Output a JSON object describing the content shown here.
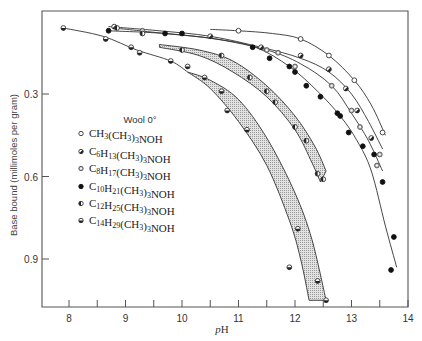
{
  "chart_data": {
    "type": "line",
    "title": "",
    "xlabel": "pH",
    "ylabel": "Base bound (millimoles per gram)",
    "xlim": [
      7.55,
      14
    ],
    "ylim": [
      0.0,
      1.08
    ],
    "y_inverted": true,
    "xticks": [
      8,
      9,
      10,
      11,
      12,
      13,
      14
    ],
    "xticks_minor": [
      8.5,
      9.5,
      10.5,
      11.5,
      12.5,
      13.5
    ],
    "yticks": [
      0.3,
      0.6,
      0.9
    ],
    "grid": false,
    "legend": {
      "title": "Wool 0°",
      "position": "inside-left",
      "entries": [
        {
          "label": "CH3(CH3)3NOH",
          "display": "CH₃(CH₃)₃NOH",
          "marker": "open-circle"
        },
        {
          "label": "C6H13(CH3)3NOH",
          "display": "C₆H₁₃(CH₃)₃NOH",
          "marker": "half-filled-circle"
        },
        {
          "label": "C8H17(CH3)3NOH",
          "display": "C₈H₁₇(CH₃)₃NOH",
          "marker": "gray-circle"
        },
        {
          "label": "C10H21(CH3)3NOH",
          "display": "C₁₀H₂₁(CH₃)₃NOH",
          "marker": "filled-circle"
        },
        {
          "label": "C12H25(CH3)3NOH",
          "display": "C₁₂H₂₅(CH₃)₃NOH",
          "marker": "left-half-circle"
        },
        {
          "label": "C14H29(CH3)3NOH",
          "display": "C₁₄H₂₉(CH₃)₃NOH",
          "marker": "bottom-half-circle"
        }
      ]
    },
    "series": [
      {
        "name": "CH3(CH3)3NOH",
        "marker": "open-circle",
        "points": [
          [
            11.0,
            0.07
          ],
          [
            12.1,
            0.1
          ],
          [
            12.6,
            0.16
          ],
          [
            13.05,
            0.25
          ],
          [
            13.55,
            0.44
          ]
        ],
        "curve": [
          [
            10.5,
            0.065
          ],
          [
            11.0,
            0.07
          ],
          [
            11.6,
            0.08
          ],
          [
            12.1,
            0.1
          ],
          [
            12.6,
            0.16
          ],
          [
            13.05,
            0.25
          ],
          [
            13.35,
            0.34
          ],
          [
            13.6,
            0.45
          ]
        ]
      },
      {
        "name": "C6H13(CH3)3NOH",
        "marker": "half-filled-circle",
        "points": [
          [
            8.8,
            0.055
          ],
          [
            10.5,
            0.09
          ],
          [
            11.4,
            0.13
          ],
          [
            12.1,
            0.16
          ],
          [
            12.6,
            0.21
          ],
          [
            12.9,
            0.28
          ],
          [
            13.1,
            0.36
          ],
          [
            13.35,
            0.46
          ]
        ],
        "curve": [
          [
            8.7,
            0.055
          ],
          [
            9.6,
            0.07
          ],
          [
            10.5,
            0.09
          ],
          [
            11.4,
            0.13
          ],
          [
            12.1,
            0.17
          ],
          [
            12.6,
            0.22
          ],
          [
            13.0,
            0.3
          ],
          [
            13.3,
            0.4
          ],
          [
            13.55,
            0.5
          ]
        ]
      },
      {
        "name": "C8H17(CH3)3NOH",
        "marker": "gray-circle",
        "points": [
          [
            9.3,
            0.07
          ],
          [
            11.5,
            0.14
          ],
          [
            11.7,
            0.15
          ],
          [
            12.0,
            0.2
          ],
          [
            12.65,
            0.27
          ],
          [
            13.0,
            0.36
          ],
          [
            13.15,
            0.42
          ],
          [
            13.5,
            0.52
          ],
          [
            13.45,
            0.56
          ]
        ],
        "curve": [
          [
            8.8,
            0.06
          ],
          [
            9.7,
            0.08
          ],
          [
            10.6,
            0.1
          ],
          [
            11.5,
            0.14
          ],
          [
            12.1,
            0.19
          ],
          [
            12.65,
            0.27
          ],
          [
            13.0,
            0.37
          ],
          [
            13.3,
            0.47
          ],
          [
            13.55,
            0.58
          ]
        ]
      },
      {
        "name": "C10H21(CH3)3NOH",
        "marker": "filled-circle",
        "points": [
          [
            8.7,
            0.07
          ],
          [
            9.7,
            0.08
          ],
          [
            10.0,
            0.08
          ],
          [
            11.25,
            0.13
          ],
          [
            11.55,
            0.17
          ],
          [
            11.9,
            0.2
          ],
          [
            12.0,
            0.22
          ],
          [
            12.2,
            0.27
          ],
          [
            12.45,
            0.31
          ],
          [
            12.75,
            0.37
          ],
          [
            12.8,
            0.38
          ],
          [
            12.95,
            0.44
          ],
          [
            13.2,
            0.49
          ],
          [
            13.4,
            0.52
          ],
          [
            13.55,
            0.62
          ],
          [
            13.75,
            0.82
          ],
          [
            13.7,
            0.94
          ]
        ],
        "curve": [
          [
            8.7,
            0.07
          ],
          [
            9.7,
            0.08
          ],
          [
            10.6,
            0.1
          ],
          [
            11.3,
            0.13
          ],
          [
            11.9,
            0.2
          ],
          [
            12.4,
            0.29
          ],
          [
            12.8,
            0.38
          ],
          [
            13.1,
            0.47
          ],
          [
            13.35,
            0.58
          ],
          [
            13.6,
            0.78
          ],
          [
            13.8,
            0.93
          ]
        ]
      },
      {
        "name": "C12H25(CH3)3NOH",
        "marker": "left-half-circle",
        "points": [
          [
            8.85,
            0.06
          ],
          [
            9.3,
            0.08
          ],
          [
            10.0,
            0.14
          ],
          [
            10.7,
            0.16
          ],
          [
            11.2,
            0.24
          ],
          [
            11.5,
            0.29
          ],
          [
            11.65,
            0.33
          ],
          [
            12.0,
            0.42
          ],
          [
            12.2,
            0.47
          ],
          [
            12.4,
            0.59
          ],
          [
            12.5,
            0.61
          ]
        ],
        "band": {
          "upper": [
            [
              9.6,
              0.12
            ],
            [
              10.3,
              0.14
            ],
            [
              10.9,
              0.18
            ],
            [
              11.5,
              0.27
            ],
            [
              12.0,
              0.38
            ],
            [
              12.35,
              0.49
            ],
            [
              12.55,
              0.58
            ]
          ],
          "lower": [
            [
              9.6,
              0.13
            ],
            [
              10.3,
              0.16
            ],
            [
              10.9,
              0.22
            ],
            [
              11.5,
              0.31
            ],
            [
              12.0,
              0.43
            ],
            [
              12.3,
              0.55
            ],
            [
              12.45,
              0.62
            ]
          ]
        },
        "fill": "#c8c8c8"
      },
      {
        "name": "C14H29(CH3)3NOH",
        "marker": "bottom-half-circle",
        "points": [
          [
            7.9,
            0.06
          ],
          [
            8.65,
            0.1
          ],
          [
            9.1,
            0.13
          ],
          [
            9.25,
            0.15
          ],
          [
            9.8,
            0.18
          ],
          [
            10.1,
            0.2
          ],
          [
            10.4,
            0.24
          ],
          [
            10.7,
            0.29
          ],
          [
            10.8,
            0.36
          ],
          [
            11.15,
            0.43
          ],
          [
            12.05,
            0.79
          ],
          [
            11.9,
            0.93
          ],
          [
            12.4,
            0.98
          ],
          [
            12.55,
            1.05
          ]
        ],
        "band": {
          "upper": [
            [
              10.1,
              0.22
            ],
            [
              10.5,
              0.25
            ],
            [
              11.0,
              0.32
            ],
            [
              11.5,
              0.46
            ],
            [
              12.0,
              0.66
            ],
            [
              12.3,
              0.83
            ],
            [
              12.55,
              1.05
            ]
          ],
          "lower": [
            [
              10.1,
              0.22
            ],
            [
              10.5,
              0.28
            ],
            [
              11.0,
              0.4
            ],
            [
              11.5,
              0.56
            ],
            [
              11.9,
              0.76
            ],
            [
              12.1,
              0.9
            ],
            [
              12.25,
              1.05
            ]
          ]
        },
        "curve": [
          [
            7.9,
            0.06
          ],
          [
            8.6,
            0.09
          ],
          [
            9.2,
            0.14
          ],
          [
            9.8,
            0.18
          ],
          [
            10.1,
            0.22
          ]
        ],
        "fill": "#c8c8c8"
      }
    ]
  },
  "axes": {
    "y_title": "Base bound (millimoles per gram)",
    "x_title_italic": "p",
    "x_title_rest": "H",
    "y_tick_labels": [
      "0.3",
      "0.6",
      "0.9"
    ],
    "x_tick_labels": [
      "8",
      "9",
      "10",
      "11",
      "12",
      "13",
      "14"
    ]
  },
  "legend": {
    "title": "Wool 0°",
    "items": [
      {
        "base": "CH",
        "parts": [
          [
            "CH",
            ""
          ],
          [
            "3",
            "sub"
          ],
          [
            "(CH",
            ""
          ],
          [
            "3",
            "sub"
          ],
          [
            ")",
            ""
          ],
          [
            "3",
            "sub"
          ],
          [
            "NOH",
            ""
          ]
        ]
      },
      {
        "parts": [
          [
            "C",
            ""
          ],
          [
            "6",
            "sub"
          ],
          [
            "H",
            ""
          ],
          [
            "13",
            "sub"
          ],
          [
            "(CH",
            ""
          ],
          [
            "3",
            "sub"
          ],
          [
            ")",
            ""
          ],
          [
            "3",
            "sub"
          ],
          [
            "NOH",
            ""
          ]
        ]
      },
      {
        "parts": [
          [
            "C",
            ""
          ],
          [
            "8",
            "sub"
          ],
          [
            "H",
            ""
          ],
          [
            "17",
            "sub"
          ],
          [
            "(CH",
            ""
          ],
          [
            "3",
            "sub"
          ],
          [
            ")",
            ""
          ],
          [
            "3",
            "sub"
          ],
          [
            "NOH",
            ""
          ]
        ]
      },
      {
        "parts": [
          [
            "C",
            ""
          ],
          [
            "10",
            "sub"
          ],
          [
            "H",
            ""
          ],
          [
            "21",
            "sub"
          ],
          [
            "(CH",
            ""
          ],
          [
            "3",
            "sub"
          ],
          [
            ")",
            ""
          ],
          [
            "3",
            "sub"
          ],
          [
            "NOH",
            ""
          ]
        ]
      },
      {
        "parts": [
          [
            "C",
            ""
          ],
          [
            "12",
            "sub"
          ],
          [
            "H",
            ""
          ],
          [
            "25",
            "sub"
          ],
          [
            "(CH",
            ""
          ],
          [
            "3",
            "sub"
          ],
          [
            ")",
            ""
          ],
          [
            "3",
            "sub"
          ],
          [
            "NOH",
            ""
          ]
        ]
      },
      {
        "parts": [
          [
            "C",
            ""
          ],
          [
            "14",
            "sub"
          ],
          [
            "H",
            ""
          ],
          [
            "29",
            "sub"
          ],
          [
            "(CH",
            ""
          ],
          [
            "3",
            "sub"
          ],
          [
            ")",
            ""
          ],
          [
            "3",
            "sub"
          ],
          [
            "NOH",
            ""
          ]
        ]
      }
    ]
  },
  "colors": {
    "line": "#333333",
    "band_fill": "#c9c9c9",
    "marker_gray": "#b0b0b0",
    "frame": "#555555"
  }
}
